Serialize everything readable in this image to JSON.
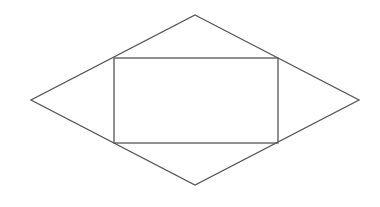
{
  "diagram": {
    "stroke_color": "#555555",
    "background": "#ffffff",
    "rhombus": {
      "points": [
        [
          195,
          15
        ],
        [
          359,
          100
        ],
        [
          195,
          185
        ],
        [
          31,
          100
        ]
      ]
    },
    "rectangle": {
      "x": 114,
      "y": 58,
      "width": 164,
      "height": 85
    }
  }
}
